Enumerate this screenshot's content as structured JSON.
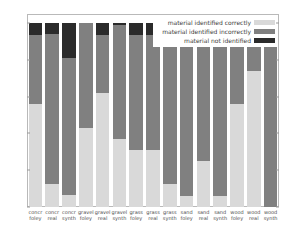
{
  "chart_data": {
    "type": "bar",
    "stacked": true,
    "title": "",
    "xlabel": "",
    "ylabel": "",
    "ylim": [
      0,
      105
    ],
    "yticks": [
      0,
      20,
      40,
      60,
      80,
      100
    ],
    "grid": false,
    "legend_position": "top-right",
    "categories": [
      "concr foley",
      "concr real",
      "concr synth",
      "gravel foley",
      "gravel real",
      "gravel synth",
      "grass foley",
      "grass real",
      "grass synth",
      "sand foley",
      "sand real",
      "sand synth",
      "wood foley",
      "wood real",
      "wood synth"
    ],
    "category_lines": [
      [
        "concr",
        "foley"
      ],
      [
        "concr",
        "real"
      ],
      [
        "concr",
        "synth"
      ],
      [
        "gravel",
        "foley"
      ],
      [
        "gravel",
        "real"
      ],
      [
        "gravel",
        "synth"
      ],
      [
        "grass",
        "foley"
      ],
      [
        "grass",
        "real"
      ],
      [
        "grass",
        "synth"
      ],
      [
        "sand",
        "foley"
      ],
      [
        "sand",
        "real"
      ],
      [
        "sand",
        "synth"
      ],
      [
        "wood",
        "foley"
      ],
      [
        "wood",
        "real"
      ],
      [
        "wood",
        "synth"
      ]
    ],
    "series": [
      {
        "name": "material identified correctly",
        "color": "#d9d9d9",
        "values": [
          56,
          12.5,
          6.5,
          43,
          62,
          37,
          31,
          31,
          12.5,
          6,
          25,
          6,
          56,
          74,
          0
        ]
      },
      {
        "name": "material identified incorrectly",
        "color": "#808080",
        "values": [
          37.5,
          81.5,
          74.5,
          57,
          31.5,
          62,
          62.5,
          62.5,
          81,
          90.5,
          75,
          94,
          39,
          26,
          87
        ]
      },
      {
        "name": "material not identified",
        "color": "#2b2b2b",
        "values": [
          6.5,
          6,
          19,
          0,
          6.5,
          1,
          6.5,
          6.5,
          6.5,
          3.5,
          0,
          0,
          5,
          0,
          13
        ]
      }
    ]
  },
  "legend": {
    "items": [
      {
        "label": "material identified correctly",
        "color": "#d9d9d9"
      },
      {
        "label": "material identified incorrectly",
        "color": "#808080"
      },
      {
        "label": "material not identified",
        "color": "#2b2b2b"
      }
    ]
  },
  "axis": {
    "y_tick_labels": [
      "0",
      "20",
      "40",
      "60",
      "80",
      "100"
    ]
  }
}
